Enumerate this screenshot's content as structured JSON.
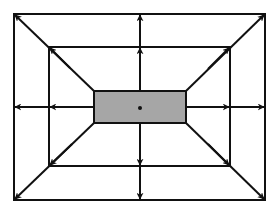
{
  "diagram": {
    "type": "expansion-arrows-diagram",
    "colors": {
      "background": "#ffffff",
      "stroke": "#111111",
      "center_fill": "#a6a6a6",
      "center_dot": "#111111"
    },
    "outer_rect": {
      "x1": 14,
      "y1": 14,
      "x2": 265,
      "y2": 200
    },
    "inner_rect": {
      "x1": 49,
      "y1": 47,
      "x2": 230,
      "y2": 166
    },
    "center_rect": {
      "x1": 94,
      "y1": 91,
      "x2": 186,
      "y2": 123
    },
    "center_point": {
      "x": 140,
      "y": 107
    },
    "arrow_directions": [
      "up",
      "down",
      "left",
      "right",
      "up-left",
      "up-right",
      "down-left",
      "down-right"
    ],
    "arrows_per_direction": 2
  }
}
